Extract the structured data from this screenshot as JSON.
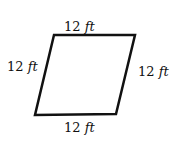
{
  "diagram": {
    "shape": "rhombus",
    "stroke_color": "#111111",
    "vertices": [
      [
        54,
        35
      ],
      [
        135,
        35
      ],
      [
        116,
        114
      ],
      [
        35,
        115
      ]
    ],
    "sides": [
      {
        "position": "top",
        "value": "12",
        "unit": "ft"
      },
      {
        "position": "left",
        "value": "12",
        "unit": "ft"
      },
      {
        "position": "right",
        "value": "12",
        "unit": "ft"
      },
      {
        "position": "bottom",
        "value": "12",
        "unit": "ft"
      }
    ]
  }
}
